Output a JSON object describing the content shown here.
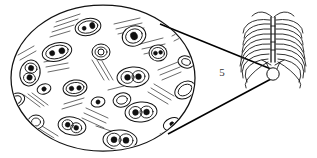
{
  "figure": {
    "background_color": "#ffffff",
    "ink_color": "#111111",
    "width": 317,
    "height": 158
  },
  "labels": {
    "callout_number": "5"
  },
  "magnified_view": {
    "name": "tissue-histology-ellipse",
    "shape": "ellipse",
    "center_x": 103,
    "center_y": 78,
    "radius_x": 92,
    "radius_y": 73,
    "description": "Light-microscope view of striated tissue with nucleated cells",
    "cells": [
      {
        "cx": 88,
        "cy": 27,
        "rx": 13,
        "ry": 8.5,
        "rot": -12,
        "nuclei": [
          {
            "dx": -4.0,
            "dy": 0.5,
            "r": 2.0
          },
          {
            "dx": 4.5,
            "dy": -0.5,
            "r": 2.6
          }
        ]
      },
      {
        "cx": 134,
        "cy": 36,
        "rx": 12,
        "ry": 10,
        "rot": -20,
        "nuclei": [
          {
            "dx": 0.0,
            "dy": 0.0,
            "r": 3.4
          }
        ]
      },
      {
        "cx": 57,
        "cy": 52,
        "rx": 15,
        "ry": 9,
        "rot": -14,
        "nuclei": [
          {
            "dx": -5.0,
            "dy": 0.0,
            "r": 2.6
          },
          {
            "dx": 5.0,
            "dy": 0.0,
            "r": 3.0
          }
        ]
      },
      {
        "cx": 101,
        "cy": 52,
        "rx": 9,
        "ry": 8,
        "rot": 0,
        "nuclei": [
          {
            "dx": 0.0,
            "dy": 0.0,
            "r": 3.0
          }
        ]
      },
      {
        "cx": 158,
        "cy": 53,
        "rx": 9,
        "ry": 8,
        "rot": 8,
        "nuclei": [
          {
            "dx": -2.5,
            "dy": 0.5,
            "r": 2.0
          },
          {
            "dx": 2.5,
            "dy": -1.0,
            "r": 1.9
          }
        ]
      },
      {
        "cx": 30,
        "cy": 73,
        "rx": 10,
        "ry": 13,
        "rot": 12,
        "nuclei": [
          {
            "dx": 0.0,
            "dy": -5.0,
            "r": 2.7
          },
          {
            "dx": 0.5,
            "dy": 4.5,
            "r": 2.7
          }
        ]
      },
      {
        "cx": 133,
        "cy": 77,
        "rx": 16,
        "ry": 10,
        "rot": -4,
        "nuclei": [
          {
            "dx": -5.5,
            "dy": 0.0,
            "r": 2.9
          },
          {
            "dx": 5.5,
            "dy": 0.0,
            "r": 2.9
          }
        ]
      },
      {
        "cx": 75,
        "cy": 88,
        "rx": 12,
        "ry": 8,
        "rot": -8,
        "nuclei": [
          {
            "dx": -3.5,
            "dy": 0.0,
            "r": 2.3
          },
          {
            "dx": 4.0,
            "dy": 0.5,
            "r": 2.3
          }
        ]
      },
      {
        "cx": 44,
        "cy": 89,
        "rx": 7,
        "ry": 5,
        "rot": -18,
        "nuclei": [
          {
            "dx": 0.0,
            "dy": 0.0,
            "r": 2.2
          }
        ]
      },
      {
        "cx": 185,
        "cy": 90,
        "rx": 11,
        "ry": 8,
        "rot": -34,
        "nuclei": []
      },
      {
        "cx": 98,
        "cy": 102,
        "rx": 7,
        "ry": 5,
        "rot": -12,
        "nuclei": [
          {
            "dx": 0.0,
            "dy": 0.0,
            "r": 2.1
          }
        ]
      },
      {
        "cx": 122,
        "cy": 100,
        "rx": 9,
        "ry": 7,
        "rot": -16,
        "nuclei": []
      },
      {
        "cx": 141,
        "cy": 112,
        "rx": 16,
        "ry": 10,
        "rot": -5,
        "nuclei": [
          {
            "dx": -5.5,
            "dy": 0.0,
            "r": 2.9
          },
          {
            "dx": 5.5,
            "dy": 0.5,
            "r": 2.9
          }
        ]
      },
      {
        "cx": 36,
        "cy": 122,
        "rx": 8,
        "ry": 7,
        "rot": 0,
        "nuclei": []
      },
      {
        "cx": 72,
        "cy": 126,
        "rx": 14,
        "ry": 9,
        "rot": 10,
        "nuclei": [
          {
            "dx": -4.5,
            "dy": -0.5,
            "r": 2.4
          },
          {
            "dx": 4.5,
            "dy": 1.0,
            "r": 2.4
          }
        ]
      },
      {
        "cx": 120,
        "cy": 140,
        "rx": 17,
        "ry": 10,
        "rot": 3,
        "nuclei": [
          {
            "dx": -6.0,
            "dy": 0.0,
            "r": 3.0
          },
          {
            "dx": 6.0,
            "dy": 0.0,
            "r": 3.0
          }
        ]
      },
      {
        "cx": 172,
        "cy": 124,
        "rx": 9,
        "ry": 6,
        "rot": -22,
        "nuclei": [
          {
            "dx": 0.0,
            "dy": 0.0,
            "r": 2.2
          }
        ]
      }
    ],
    "striations": [
      {
        "x1": 56,
        "y1": 22,
        "x2": 80,
        "y2": 14
      },
      {
        "x1": 54,
        "y1": 27,
        "x2": 78,
        "y2": 19
      },
      {
        "x1": 52,
        "y1": 32,
        "x2": 74,
        "y2": 25
      },
      {
        "x1": 114,
        "y1": 24,
        "x2": 140,
        "y2": 18
      },
      {
        "x1": 116,
        "y1": 29,
        "x2": 142,
        "y2": 23
      },
      {
        "x1": 140,
        "y1": 44,
        "x2": 163,
        "y2": 38
      },
      {
        "x1": 142,
        "y1": 49,
        "x2": 165,
        "y2": 44
      },
      {
        "x1": 92,
        "y1": 60,
        "x2": 104,
        "y2": 80
      },
      {
        "x1": 97,
        "y1": 60,
        "x2": 109,
        "y2": 80
      },
      {
        "x1": 44,
        "y1": 62,
        "x2": 66,
        "y2": 58
      },
      {
        "x1": 46,
        "y1": 67,
        "x2": 68,
        "y2": 63
      },
      {
        "x1": 158,
        "y1": 70,
        "x2": 178,
        "y2": 62
      },
      {
        "x1": 160,
        "y1": 75,
        "x2": 180,
        "y2": 67
      },
      {
        "x1": 24,
        "y1": 95,
        "x2": 40,
        "y2": 107
      },
      {
        "x1": 28,
        "y1": 94,
        "x2": 44,
        "y2": 106
      },
      {
        "x1": 86,
        "y1": 108,
        "x2": 108,
        "y2": 118
      },
      {
        "x1": 84,
        "y1": 113,
        "x2": 106,
        "y2": 123
      },
      {
        "x1": 148,
        "y1": 92,
        "x2": 168,
        "y2": 104
      },
      {
        "x1": 151,
        "y1": 88,
        "x2": 171,
        "y2": 100
      },
      {
        "x1": 34,
        "y1": 130,
        "x2": 50,
        "y2": 140
      },
      {
        "x1": 38,
        "y1": 128,
        "x2": 54,
        "y2": 138
      },
      {
        "x1": 160,
        "y1": 134,
        "x2": 180,
        "y2": 126
      },
      {
        "x1": 162,
        "y1": 139,
        "x2": 182,
        "y2": 131
      },
      {
        "x1": 96,
        "y1": 126,
        "x2": 114,
        "y2": 132
      },
      {
        "x1": 64,
        "y1": 104,
        "x2": 84,
        "y2": 98
      }
    ]
  },
  "locator_view": {
    "name": "thoracic-ribcage",
    "description": "Anterior view of the human ribcage with sternum and xiphoid marker",
    "center_x": 273,
    "center_y": 47,
    "rib_pair_count": 9,
    "marker": {
      "name": "sample-site-marker",
      "cx": 273,
      "cy": 74,
      "r": 6.2,
      "description": "Circular marker indicating the magnified sample site"
    }
  },
  "callout_lines": {
    "name": "magnification-callout",
    "upper": {
      "x1": 160,
      "y1": 24,
      "x2": 271,
      "y2": 69
    },
    "lower": {
      "x1": 168,
      "y1": 134,
      "x2": 271,
      "y2": 79
    }
  }
}
